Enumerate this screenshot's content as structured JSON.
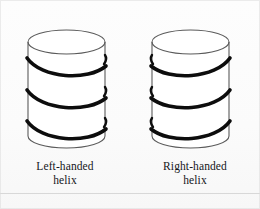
{
  "figure": {
    "background_color": "#fdfdfd",
    "line_color": "#231f20",
    "helix_color": "#0d0d0d",
    "outline_color": "#4a4a4a",
    "baseline_rule_color": "#d8d8d8"
  },
  "panels": [
    {
      "id": "left-handed",
      "handedness": "left",
      "caption_line1": "Left-handed",
      "caption_line2": "helix",
      "cylinder": {
        "left_x": 28,
        "right_x": 105,
        "top_y": 30,
        "bottom_y": 148,
        "ellipse_ry": 12
      },
      "helix_turns": 3,
      "helix_band_y": [
        60,
        94,
        126
      ],
      "helix_direction": "rises-to-the-right"
    },
    {
      "id": "right-handed",
      "handedness": "right",
      "caption_line1": "Right-handed",
      "caption_line2": "helix",
      "cylinder": {
        "left_x": 152,
        "right_x": 229,
        "top_y": 30,
        "bottom_y": 148,
        "ellipse_ry": 12
      },
      "helix_turns": 3,
      "helix_band_y": [
        60,
        94,
        126
      ],
      "helix_direction": "rises-to-the-left"
    }
  ]
}
